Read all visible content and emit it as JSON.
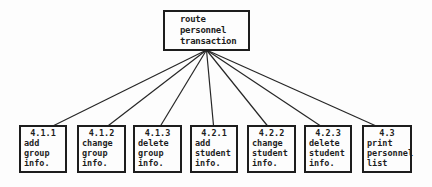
{
  "diagram": {
    "background": "#fdfdfd",
    "line_color": "#262626",
    "root": {
      "lines": [
        "route",
        "personnel",
        "transaction"
      ]
    },
    "children": [
      {
        "number": "4.1.1",
        "lines": [
          "add",
          "group",
          "info."
        ]
      },
      {
        "number": "4.1.2",
        "lines": [
          "change",
          "group",
          "info."
        ]
      },
      {
        "number": "4.1.3",
        "lines": [
          "delete",
          "group",
          "info."
        ]
      },
      {
        "number": "4.2.1",
        "lines": [
          "add",
          "student",
          "info."
        ]
      },
      {
        "number": "4.2.2",
        "lines": [
          "change",
          "student",
          "info."
        ]
      },
      {
        "number": "4.2.3",
        "lines": [
          "delete",
          "student",
          "info."
        ]
      },
      {
        "number": "4.3",
        "lines": [
          "print",
          "personnel",
          "list"
        ]
      }
    ]
  }
}
